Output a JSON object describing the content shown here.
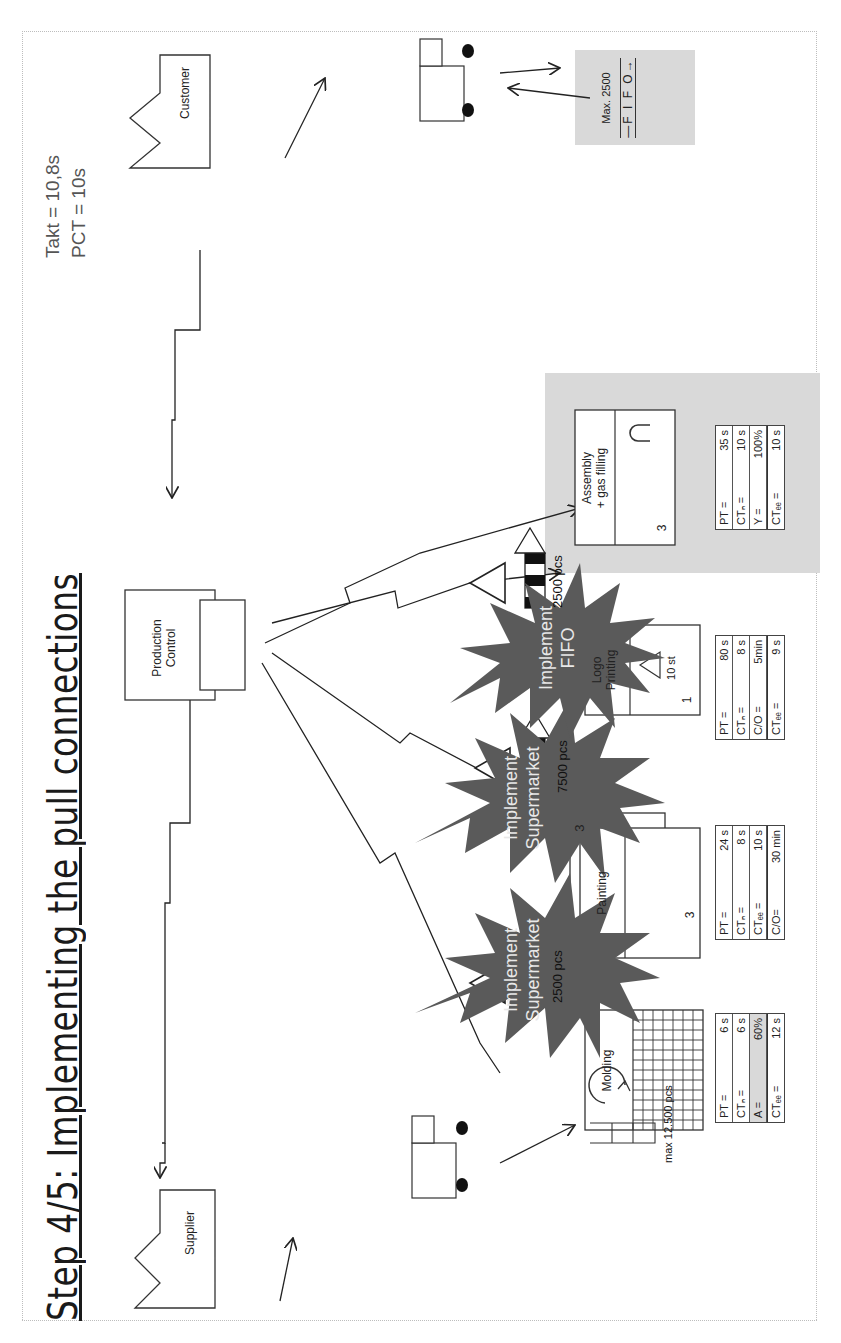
{
  "slide": {
    "title": "Step 4/5: Implementing the pull connections",
    "takt": "Takt = 10,8s",
    "pct": "PCT = 10s"
  },
  "entities": {
    "customer": "Customer",
    "supplier": "Supplier",
    "production_control_line1": "Production",
    "production_control_line2": "Control"
  },
  "fifo_lane": {
    "max": "Max. 2500",
    "label": "—F I F O→"
  },
  "processes": [
    {
      "name": "Molding",
      "data": [
        {
          "k": "PT =",
          "v": "6 s"
        },
        {
          "k": "CTₙ =",
          "v": "6 s"
        },
        {
          "k": "A =",
          "v": "60%",
          "highlight": true
        },
        {
          "k": "CTₑₑ =",
          "v": "12 s"
        }
      ]
    },
    {
      "name": "Painting",
      "operators": "3",
      "parallel": "3",
      "data": [
        {
          "k": "PT =",
          "v": "24 s"
        },
        {
          "k": "CTₙ =",
          "v": "8 s"
        },
        {
          "k": "CTₑₑ =",
          "v": "10 s"
        },
        {
          "k": "C/O=",
          "v": "30 min"
        }
      ]
    },
    {
      "name_line1": "Logo",
      "name_line2": "Printing",
      "stock": "10 st",
      "operators": "1",
      "data": [
        {
          "k": "PT =",
          "v": "80 s"
        },
        {
          "k": "CTₙ =",
          "v": "8 s"
        },
        {
          "k": "C/O =",
          "v": "5min"
        },
        {
          "k": "CTₑₑ =",
          "v": "9 s"
        }
      ]
    },
    {
      "name_line1": "Assembly",
      "name_line2": "+ gas filling",
      "operators": "3",
      "data": [
        {
          "k": "PT =",
          "v": "35 s"
        },
        {
          "k": "CTₙ =",
          "v": "10 s"
        },
        {
          "k": "Y =",
          "v": "100%"
        },
        {
          "k": "CTₑₑ =",
          "v": "10 s"
        }
      ]
    }
  ],
  "inventory": {
    "raw": "max 12.500 pcs",
    "after_molding": "2500 pcs",
    "after_painting": "7500 pcs",
    "after_logo": "2500 pcs"
  },
  "bursts": [
    {
      "line1": "Implement",
      "line2": "Supermarket"
    },
    {
      "line1": "Implement",
      "line2": "Supermarket"
    },
    {
      "line1": "Implement",
      "line2": "FIFO"
    }
  ],
  "colors": {
    "burst": "#5a5a5a",
    "gray_zone": "#d9d9d9",
    "line": "#222222"
  }
}
